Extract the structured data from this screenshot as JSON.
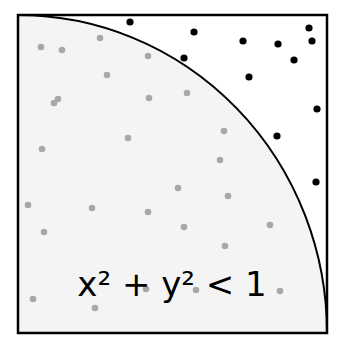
{
  "diagram": {
    "formula": "x² + y² < 1",
    "colors": {
      "background": "#ffffff",
      "inside_fill": "#f4f4f4",
      "border": "#000000",
      "inside_point": "#a8a8a8",
      "outside_point": "#000000"
    },
    "box": {
      "left": 18,
      "top": 15,
      "right": 327,
      "bottom": 333
    },
    "arc": {
      "cx": 18,
      "cy": 333,
      "rx": 309,
      "ry": 318
    },
    "inside_points": [
      [
        41,
        47
      ],
      [
        62,
        50
      ],
      [
        100,
        38
      ],
      [
        107,
        75
      ],
      [
        58,
        99
      ],
      [
        54,
        103
      ],
      [
        148,
        56
      ],
      [
        149,
        98
      ],
      [
        187,
        93
      ],
      [
        42,
        149
      ],
      [
        128,
        138
      ],
      [
        224,
        131
      ],
      [
        220,
        160
      ],
      [
        28,
        205
      ],
      [
        92,
        208
      ],
      [
        178,
        188
      ],
      [
        228,
        196
      ],
      [
        148,
        212
      ],
      [
        184,
        227
      ],
      [
        44,
        232
      ],
      [
        270,
        225
      ],
      [
        225,
        246
      ],
      [
        33,
        299
      ],
      [
        95,
        308
      ],
      [
        146,
        289
      ],
      [
        196,
        290
      ],
      [
        280,
        291
      ]
    ],
    "outside_points": [
      [
        130,
        22
      ],
      [
        194,
        32
      ],
      [
        243,
        41
      ],
      [
        278,
        44
      ],
      [
        309,
        28
      ],
      [
        312,
        41
      ],
      [
        294,
        60
      ],
      [
        184,
        58
      ],
      [
        249,
        77
      ],
      [
        317,
        109
      ],
      [
        277,
        136
      ],
      [
        316,
        182
      ]
    ],
    "counts": {
      "inside": 27,
      "outside": 12
    }
  }
}
